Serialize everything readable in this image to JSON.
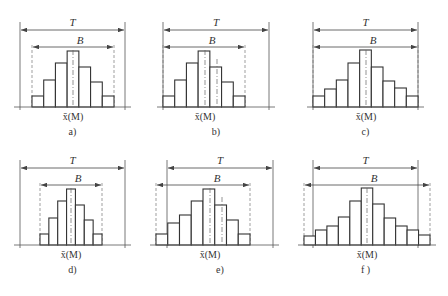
{
  "figure": {
    "panels": [
      {
        "id": "a",
        "caption": "a)",
        "x_label": "x̄(M)",
        "T_label": "T",
        "B_label": "B",
        "T": [
          20,
          125
        ],
        "B": [
          32,
          114
        ],
        "bars_x": [
          32,
          114
        ],
        "heights": [
          11,
          27,
          44,
          56,
          40,
          25,
          11
        ],
        "center": 73,
        "shift": null,
        "origin_y": 0
      },
      {
        "id": "b",
        "caption": "b)",
        "x_label": "x̄(M)",
        "T_label": "T",
        "B_label": "B",
        "T": [
          163,
          269
        ],
        "B": [
          163,
          245
        ],
        "bars_x": [
          163,
          245
        ],
        "heights": [
          11,
          27,
          44,
          56,
          40,
          25,
          11
        ],
        "center": 205,
        "shift": 217,
        "origin_y": 0
      },
      {
        "id": "c",
        "caption": "c)",
        "x_label": "x̄(M)",
        "T_label": "T",
        "B_label": "B",
        "T": [
          313,
          418
        ],
        "B": [
          313,
          418
        ],
        "bars_x": [
          313,
          418
        ],
        "heights": [
          11,
          18,
          27,
          44,
          57,
          40,
          26,
          19,
          11
        ],
        "center": 366,
        "shift": null,
        "origin_y": 0
      },
      {
        "id": "d",
        "caption": "d)",
        "x_label": "x̄(M)",
        "T_label": "T",
        "B_label": "B",
        "T": [
          20,
          125
        ],
        "B": [
          40,
          102
        ],
        "bars_x": [
          40,
          102
        ],
        "heights": [
          11,
          27,
          44,
          56,
          40,
          25,
          11
        ],
        "center": 71,
        "shift": null,
        "origin_y": 138
      },
      {
        "id": "e",
        "caption": "e)",
        "x_label": "x̄(M)",
        "T_label": "T",
        "B_label": "B",
        "T": [
          167,
          273
        ],
        "B": [
          156,
          250
        ],
        "bars_x": [
          156,
          250
        ],
        "heights": [
          11,
          22,
          30,
          44,
          56,
          40,
          25,
          11
        ],
        "center": 210,
        "shift": 222,
        "origin_y": 138
      },
      {
        "id": "f",
        "caption": "f )",
        "x_label": "x̄(M)",
        "T_label": "T",
        "B_label": "B",
        "T": [
          313,
          418
        ],
        "B": [
          304,
          430
        ],
        "bars_x": [
          304,
          430
        ],
        "heights": [
          9,
          15,
          19,
          28,
          44,
          57,
          41,
          27,
          19,
          15,
          10
        ],
        "center": 367,
        "shift": null,
        "origin_y": 138
      }
    ]
  },
  "chart_data": [
    {
      "type": "bar",
      "title": "a)",
      "description": "process spread B centered within tolerance T",
      "values": [
        11,
        27,
        44,
        56,
        40,
        25,
        11
      ],
      "xlabel": "x̄(M)",
      "annotations": [
        "T",
        "B"
      ]
    },
    {
      "type": "bar",
      "title": "b)",
      "description": "distribution shifted toward one tolerance limit",
      "values": [
        11,
        27,
        44,
        56,
        40,
        25,
        11
      ],
      "xlabel": "x̄(M)",
      "annotations": [
        "T",
        "B"
      ]
    },
    {
      "type": "bar",
      "title": "c)",
      "description": "B equals T, no margin",
      "values": [
        11,
        18,
        27,
        44,
        57,
        40,
        26,
        19,
        11
      ],
      "xlabel": "x̄(M)",
      "annotations": [
        "T",
        "B"
      ]
    },
    {
      "type": "bar",
      "title": "d)",
      "description": "B much narrower than T, excessive margin",
      "values": [
        11,
        27,
        44,
        56,
        40,
        25,
        11
      ],
      "xlabel": "x̄(M)",
      "annotations": [
        "T",
        "B"
      ]
    },
    {
      "type": "bar",
      "title": "e)",
      "description": "distribution shifted, exceeding lower tolerance",
      "values": [
        11,
        22,
        30,
        44,
        56,
        40,
        25,
        11
      ],
      "xlabel": "x̄(M)",
      "annotations": [
        "T",
        "B"
      ]
    },
    {
      "type": "bar",
      "title": "f)",
      "description": "B wider than T, exceeding both limits",
      "values": [
        9,
        15,
        19,
        28,
        44,
        57,
        41,
        27,
        19,
        15,
        10
      ],
      "xlabel": "x̄(M)",
      "annotations": [
        "T",
        "B"
      ]
    }
  ]
}
